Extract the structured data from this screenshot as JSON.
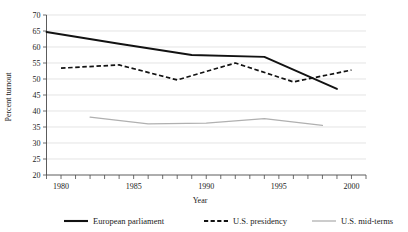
{
  "chart_data": {
    "type": "line",
    "title": "",
    "xlabel": "Year",
    "ylabel": "Percent turnout",
    "xlim": [
      1979,
      2001
    ],
    "ylim": [
      20,
      70
    ],
    "ytick_step": 5,
    "xtick_step": 1,
    "xtick_label_step": 5,
    "grid": "horizontal",
    "legend_position": "bottom",
    "yticks": [
      20,
      25,
      30,
      35,
      40,
      45,
      50,
      55,
      60,
      65,
      70
    ],
    "ytick_labels": [
      "20",
      "25",
      "30",
      "35",
      "40",
      "45",
      "50",
      "55",
      "60",
      "65",
      "70"
    ],
    "xticks": [
      1979,
      1980,
      1981,
      1982,
      1983,
      1984,
      1985,
      1986,
      1987,
      1988,
      1989,
      1990,
      1991,
      1992,
      1993,
      1994,
      1995,
      1996,
      1997,
      1998,
      1999,
      2000,
      2001
    ],
    "xtick_labels": [
      "1980",
      "1985",
      "1990",
      "1995",
      "2000"
    ],
    "xtick_label_years": [
      1980,
      1985,
      1990,
      1995,
      2000
    ],
    "series": [
      {
        "name": "European parliament",
        "style": "solid",
        "color": "#121212",
        "x": [
          1979,
          1984,
          1989,
          1994,
          1999
        ],
        "values": [
          64.7,
          61.0,
          57.5,
          56.9,
          46.9
        ]
      },
      {
        "name": "U.S. presidency",
        "style": "dashed",
        "color": "#121212",
        "x": [
          1980,
          1984,
          1988,
          1992,
          1996,
          2000
        ],
        "values": [
          53.4,
          54.4,
          49.7,
          55.0,
          49.1,
          52.8
        ]
      },
      {
        "name": "U.S. mid-terms",
        "style": "solid",
        "color": "#b0b0b0",
        "x": [
          1982,
          1986,
          1990,
          1994,
          1998
        ],
        "values": [
          38.1,
          36.0,
          36.2,
          37.6,
          35.5
        ]
      }
    ]
  },
  "legend": {
    "items": [
      {
        "label": "European parliament"
      },
      {
        "label": "U.S. presidency"
      },
      {
        "label": "U.S. mid-terms"
      }
    ]
  },
  "colors": {
    "eu": "#121212",
    "us_presidency": "#121212",
    "us_midterms": "#b0b0b0",
    "grid": "#d9d9d9",
    "axis": "#4a4a4a",
    "background": "#ffffff"
  }
}
